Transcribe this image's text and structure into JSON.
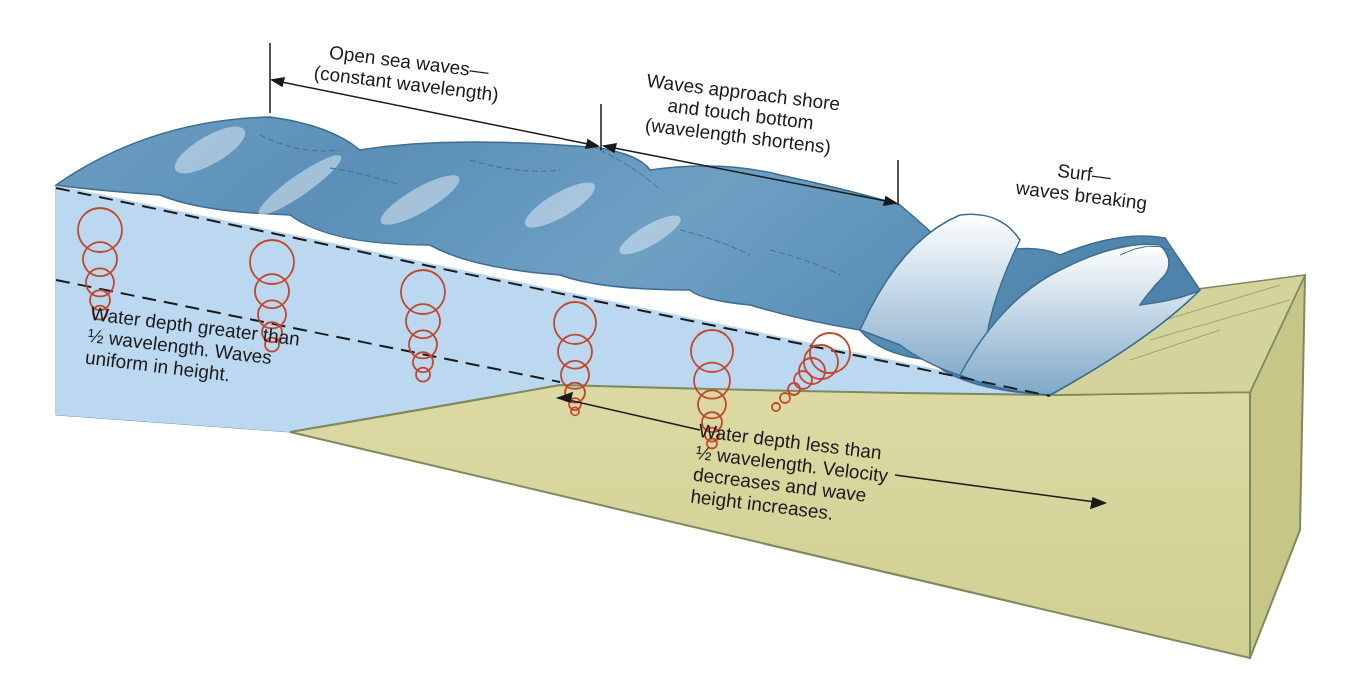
{
  "diagram": {
    "colors": {
      "sea_surface_dark": "#4f86ab",
      "sea_surface_light": "#a9cbe3",
      "water_cross_section": "#bcd8f1",
      "sediment": "#d6d49a",
      "sediment_side": "#c6c686",
      "sediment_edge": "#7d8a5e",
      "orbit_circle": "#c0482d",
      "line": "#1a1a1a",
      "foam": "#f4f8fb"
    },
    "labels": {
      "open_sea": [
        "Open sea waves—",
        "(constant wavelength)"
      ],
      "approach_shore": [
        "Waves approach shore",
        "and touch bottom",
        "(wavelength shortens)"
      ],
      "surf": [
        "Surf—",
        "waves breaking"
      ],
      "deep_water": [
        "Water depth greater than",
        "½ wavelength. Waves",
        "uniform in height."
      ],
      "shallow_water": [
        "Water depth less than",
        "½ wavelength. Velocity",
        "decreases and wave",
        "height increases."
      ]
    },
    "zones": [
      {
        "name": "Open sea waves",
        "description": "constant wavelength"
      },
      {
        "name": "Waves approach shore and touch bottom",
        "description": "wavelength shortens"
      },
      {
        "name": "Surf",
        "description": "waves breaking"
      }
    ],
    "orbit_columns": [
      {
        "x": 100,
        "top": 208,
        "circles": [
          22,
          17,
          14,
          10,
          7
        ]
      },
      {
        "x": 272,
        "top": 240,
        "circles": [
          22,
          17,
          14,
          10,
          7
        ]
      },
      {
        "x": 423,
        "top": 270,
        "circles": [
          22,
          17,
          14,
          10,
          7
        ]
      },
      {
        "x": 575,
        "top": 302,
        "circles": [
          21,
          17,
          14,
          10,
          6,
          4
        ]
      },
      {
        "x": 712,
        "top": 330,
        "circles": [
          21,
          18,
          14,
          10,
          7,
          5
        ]
      },
      {
        "x": 830,
        "top": 335,
        "circles": [
          20,
          17,
          13,
          9,
          6,
          5,
          4
        ]
      }
    ]
  }
}
